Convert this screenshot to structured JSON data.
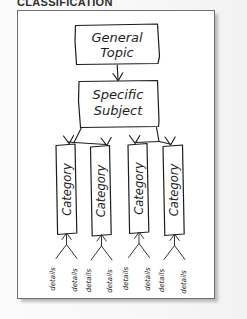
{
  "heading": "CLASSIFICATION",
  "diagram": {
    "type": "hierarchy-tree",
    "levels": [
      {
        "level": 1,
        "label": "General Topic",
        "count": 1
      },
      {
        "level": 2,
        "label": "Specific Subject",
        "count": 1
      },
      {
        "level": 3,
        "label": "Category",
        "count": 4
      },
      {
        "level": 4,
        "label": "details",
        "count": 8
      }
    ],
    "top_box": {
      "line1": "General",
      "line2": "Topic"
    },
    "second_box": {
      "line1": "Specific",
      "line2": "Subject"
    },
    "categories": [
      {
        "label": "Category"
      },
      {
        "label": "Category"
      },
      {
        "label": "Category"
      },
      {
        "label": "Category"
      }
    ],
    "details": [
      {
        "label": "details"
      },
      {
        "label": "details"
      },
      {
        "label": "details"
      },
      {
        "label": "details"
      },
      {
        "label": "details"
      },
      {
        "label": "details"
      },
      {
        "label": "details"
      },
      {
        "label": "details"
      }
    ]
  },
  "colors": {
    "ink": "#1d1d1d",
    "frame": "#6d6f74",
    "panel_background": "#ffffff",
    "page_background": "#f7f7f7"
  }
}
